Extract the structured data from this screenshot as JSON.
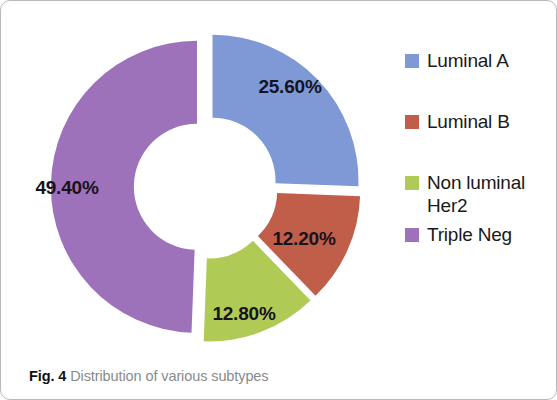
{
  "figure": {
    "caption_label": "Fig. 4",
    "caption_text": " Distribution of various subtypes"
  },
  "legend": {
    "items": [
      {
        "label": "Luminal A",
        "color": "#7f99d6"
      },
      {
        "label": "Luminal B",
        "color": "#c05e4a"
      },
      {
        "label": "Non luminal Her2",
        "color": "#afcb55"
      },
      {
        "label": "Triple Neg",
        "color": "#9e72ba"
      }
    ]
  },
  "chart_data": {
    "type": "pie",
    "variant": "exploded-donut",
    "title": "Distribution of various subtypes",
    "xlabel": "",
    "ylabel": "",
    "categories": [
      "Luminal A",
      "Luminal B",
      "Non luminal Her2",
      "Triple Neg"
    ],
    "values": [
      25.6,
      12.2,
      12.8,
      49.4
    ],
    "data_labels": [
      "25.60%",
      "12.20%",
      "12.80%",
      "49.40%"
    ],
    "colors": [
      "#7f99d6",
      "#c05e4a",
      "#afcb55",
      "#9e72ba"
    ],
    "units": "percent",
    "total": 100.0,
    "legend_position": "right",
    "grid": false,
    "start_angle_deg": 0,
    "direction": "clockwise",
    "inner_radius_ratio": 0.43,
    "explode_px": 9,
    "slices": [
      {
        "name": "Luminal A",
        "value": 25.6,
        "label": "25.60%",
        "color": "#7f99d6",
        "start_deg": 0.0,
        "end_deg": 92.16,
        "label_x": 289,
        "label_y": 86
      },
      {
        "name": "Luminal B",
        "value": 12.2,
        "label": "12.20%",
        "color": "#c05e4a",
        "start_deg": 92.16,
        "end_deg": 136.08,
        "label_x": 303,
        "label_y": 238
      },
      {
        "name": "Non luminal Her2",
        "value": 12.8,
        "label": "12.80%",
        "color": "#afcb55",
        "start_deg": 136.08,
        "end_deg": 182.16,
        "label_x": 243,
        "label_y": 313
      },
      {
        "name": "Triple Neg",
        "value": 49.4,
        "label": "49.40%",
        "color": "#9e72ba",
        "start_deg": 182.16,
        "end_deg": 360.0,
        "label_x": 66,
        "label_y": 187
      }
    ],
    "geometry": {
      "center_x": 205,
      "center_y": 186,
      "outer_radius": 146,
      "inner_radius": 63
    }
  }
}
